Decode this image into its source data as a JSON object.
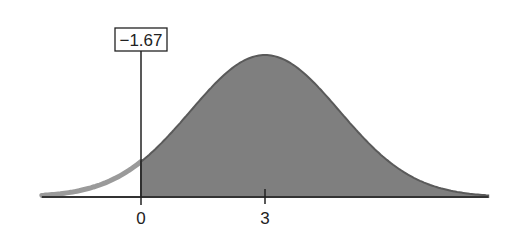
{
  "figure": {
    "z_label": "−1.67",
    "x_ticks": [
      {
        "value": 0,
        "label": "0"
      },
      {
        "value": 3,
        "label": "3"
      }
    ],
    "mean": 3,
    "std_dev": 1.8,
    "shade_from": 0,
    "x_range": [
      -2.4,
      8.4
    ],
    "colors": {
      "shaded": "#7f7f7f",
      "unshaded_curve": "#9a9a9a",
      "axis": "#333333",
      "curve_edge": "#5a5a5a"
    }
  }
}
